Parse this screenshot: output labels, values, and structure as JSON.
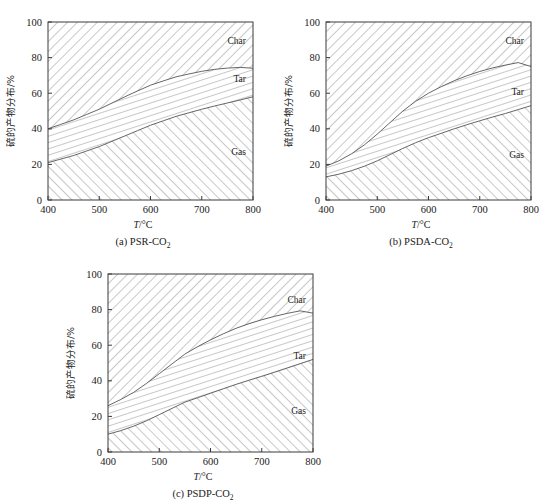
{
  "figure": {
    "panels": [
      {
        "id": "a",
        "caption_prefix": "(a) PSR-CO",
        "caption_sub": "2",
        "xlabel_sym": "T",
        "xlabel_unit": "/°C",
        "ylabel": "硫的产物分布/%"
      },
      {
        "id": "b",
        "caption_prefix": "(b) PSDA-CO",
        "caption_sub": "2",
        "xlabel_sym": "T",
        "xlabel_unit": "/°C",
        "ylabel": "硫的产物分布/%"
      },
      {
        "id": "c",
        "caption_prefix": "(c) PSDP-CO",
        "caption_sub": "2",
        "xlabel_sym": "T",
        "xlabel_unit": "/°C",
        "ylabel": "硫的产物分布/%"
      }
    ]
  },
  "chart_data": [
    {
      "type": "area",
      "id": "a",
      "title": "(a) PSR-CO2",
      "xlabel": "T/°C",
      "ylabel": "硫的产物分布/%",
      "xlim": [
        400,
        800
      ],
      "ylim": [
        0,
        100
      ],
      "xticks": [
        400,
        500,
        600,
        700,
        800
      ],
      "yticks": [
        0,
        20,
        40,
        60,
        80,
        100
      ],
      "grid": false,
      "stacked": true,
      "legend": "in-plot-labels",
      "x": [
        400,
        425,
        450,
        475,
        500,
        525,
        550,
        575,
        600,
        625,
        650,
        675,
        700,
        725,
        750,
        775,
        800
      ],
      "series": [
        {
          "name": "Gas",
          "label": "Gas",
          "hatch": "forward-slash",
          "values": [
            21,
            23,
            25,
            27.5,
            30,
            33,
            36,
            39,
            42,
            44.5,
            47,
            49,
            51,
            52.8,
            54.5,
            56.2,
            58
          ]
        },
        {
          "name": "Tar",
          "label": "Tar",
          "hatch": "steep-slash",
          "values": [
            19,
            19.5,
            20,
            20.5,
            21,
            21.5,
            22,
            22.3,
            22.5,
            22.4,
            22.2,
            21.8,
            21.3,
            20.6,
            19.6,
            18.3,
            16
          ]
        },
        {
          "name": "Char",
          "label": "Char",
          "hatch": "back-slash",
          "values": [
            60,
            57.5,
            55,
            52,
            49,
            45.5,
            42,
            38.7,
            35.5,
            33.1,
            30.8,
            29.2,
            27.7,
            26.6,
            25.9,
            25.5,
            26
          ]
        }
      ],
      "boundaries": {
        "gas_top": [
          21,
          23,
          25,
          27.5,
          30,
          33,
          36,
          39,
          42,
          44.5,
          47,
          49,
          51,
          52.8,
          54.5,
          56.2,
          58
        ],
        "tar_top": [
          40,
          42.5,
          45,
          48,
          51,
          54.5,
          58,
          61.3,
          64.5,
          66.9,
          69.2,
          70.8,
          72.3,
          73.4,
          74.1,
          74.5,
          74
        ]
      }
    },
    {
      "type": "area",
      "id": "b",
      "title": "(b) PSDA-CO2",
      "xlabel": "T/°C",
      "ylabel": "硫的产物分布/%",
      "xlim": [
        400,
        800
      ],
      "ylim": [
        0,
        100
      ],
      "xticks": [
        400,
        500,
        600,
        700,
        800
      ],
      "yticks": [
        0,
        20,
        40,
        60,
        80,
        100
      ],
      "grid": false,
      "stacked": true,
      "legend": "in-plot-labels",
      "x": [
        400,
        425,
        450,
        475,
        500,
        525,
        550,
        575,
        600,
        625,
        650,
        675,
        700,
        725,
        750,
        775,
        800
      ],
      "series": [
        {
          "name": "Gas",
          "label": "Gas",
          "hatch": "forward-slash",
          "values": [
            13,
            14.5,
            16.5,
            19,
            22,
            25.5,
            29,
            32.2,
            35,
            37.5,
            40,
            42.3,
            44.5,
            46.6,
            48.6,
            50.8,
            53
          ]
        },
        {
          "name": "Tar",
          "label": "Tar",
          "hatch": "steep-slash",
          "values": [
            6,
            7.5,
            9.5,
            12,
            15,
            18,
            21,
            23.3,
            25,
            26.2,
            27,
            27.5,
            27.7,
            27.6,
            27.2,
            26.4,
            22
          ]
        },
        {
          "name": "Char",
          "label": "Char",
          "hatch": "back-slash",
          "values": [
            81,
            78,
            74,
            69,
            63,
            56.5,
            50,
            44.5,
            40,
            36.3,
            33,
            30.2,
            27.8,
            25.8,
            24.2,
            22.8,
            25
          ]
        }
      ],
      "boundaries": {
        "gas_top": [
          13,
          14.5,
          16.5,
          19,
          22,
          25.5,
          29,
          32.2,
          35,
          37.5,
          40,
          42.3,
          44.5,
          46.6,
          48.6,
          50.8,
          53
        ],
        "tar_top": [
          19,
          22,
          26,
          31,
          37,
          43.5,
          50,
          55.5,
          60,
          63.7,
          67,
          69.8,
          72.2,
          74.2,
          75.8,
          77.2,
          75
        ]
      }
    },
    {
      "type": "area",
      "id": "c",
      "title": "(c) PSDP-CO2",
      "xlabel": "T/°C",
      "ylabel": "硫的产物分布/%",
      "xlim": [
        400,
        800
      ],
      "ylim": [
        0,
        100
      ],
      "xticks": [
        400,
        500,
        600,
        700,
        800
      ],
      "yticks": [
        0,
        20,
        40,
        60,
        80,
        100
      ],
      "grid": false,
      "stacked": true,
      "legend": "in-plot-labels",
      "x": [
        400,
        425,
        450,
        475,
        500,
        525,
        550,
        575,
        600,
        625,
        650,
        675,
        700,
        725,
        750,
        775,
        800
      ],
      "series": [
        {
          "name": "Gas",
          "label": "Gas",
          "hatch": "forward-slash",
          "values": [
            10,
            12,
            14.5,
            17.5,
            21,
            24.5,
            28,
            30.5,
            33,
            35.5,
            38,
            40.3,
            42.5,
            44.8,
            47.2,
            49.6,
            52
          ]
        },
        {
          "name": "Tar",
          "label": "Tar",
          "hatch": "steep-slash",
          "values": [
            16,
            17.5,
            19,
            21,
            23,
            25,
            27,
            28.7,
            30,
            30.9,
            31.5,
            31.8,
            31.8,
            31.4,
            30.7,
            29.7,
            26
          ]
        },
        {
          "name": "Char",
          "label": "Char",
          "hatch": "back-slash",
          "values": [
            74,
            70.5,
            66.5,
            61.5,
            56,
            50.5,
            45,
            40.8,
            37,
            33.6,
            30.5,
            27.9,
            25.7,
            23.8,
            22.1,
            20.7,
            22
          ]
        }
      ],
      "boundaries": {
        "gas_top": [
          10,
          12,
          14.5,
          17.5,
          21,
          24.5,
          28,
          30.5,
          33,
          35.5,
          38,
          40.3,
          42.5,
          44.8,
          47.2,
          49.6,
          52
        ],
        "tar_top": [
          26,
          29.5,
          33.5,
          38.5,
          44,
          49.5,
          55,
          59.2,
          63,
          66.4,
          69.5,
          72.1,
          74.3,
          76.2,
          77.9,
          79.3,
          78
        ]
      }
    }
  ]
}
